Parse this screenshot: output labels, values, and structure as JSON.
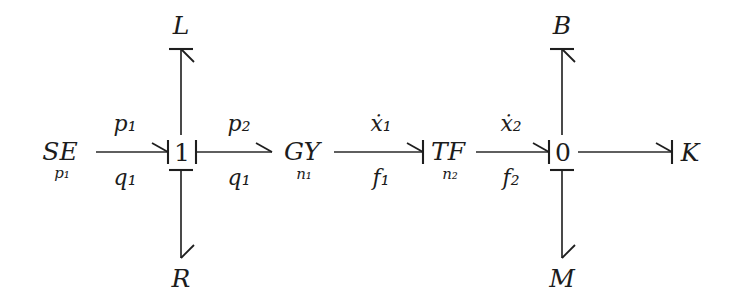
{
  "diagram": {
    "type": "bond-graph",
    "background_color": "#ffffff",
    "line_color": "#2a2a2a",
    "text_color": "#1c1c1c",
    "elements": [
      {
        "id": "SE",
        "label": "SE",
        "subscript": "p₁",
        "kind": "effort-source",
        "x": 60,
        "y": 152
      },
      {
        "id": "J1",
        "label": "1",
        "subscript": "",
        "kind": "one-junction",
        "x": 181,
        "y": 152
      },
      {
        "id": "GY",
        "label": "GY",
        "subscript": "n₁",
        "kind": "gyrator",
        "x": 300,
        "y": 152
      },
      {
        "id": "TF",
        "label": "TF",
        "subscript": "n₂",
        "kind": "transformer",
        "x": 441,
        "y": 152
      },
      {
        "id": "J0",
        "label": "0",
        "subscript": "",
        "kind": "zero-junction",
        "x": 562,
        "y": 152
      },
      {
        "id": "K",
        "label": "K",
        "subscript": "",
        "kind": "compliance",
        "x": 690,
        "y": 152
      },
      {
        "id": "L",
        "label": "L",
        "subscript": "",
        "kind": "inductance",
        "x": 181,
        "y": 25
      },
      {
        "id": "R",
        "label": "R",
        "subscript": "",
        "kind": "resistance",
        "x": 181,
        "y": 280
      },
      {
        "id": "B",
        "label": "B",
        "subscript": "",
        "kind": "damper",
        "x": 562,
        "y": 25
      },
      {
        "id": "M",
        "label": "M",
        "subscript": "",
        "kind": "mass",
        "x": 562,
        "y": 280
      }
    ],
    "bonds": [
      {
        "id": "bond-se-1",
        "from": "SE",
        "to": "J1",
        "effort": "p₁",
        "flow": "q₁",
        "orientation": "horizontal",
        "direction": "right",
        "causality_at": "head",
        "arrow_style": "half-arrow-lower"
      },
      {
        "id": "bond-1-gy",
        "from": "J1",
        "to": "GY",
        "effort": "p₂",
        "flow": "q₁",
        "orientation": "horizontal",
        "direction": "right",
        "causality_at": "tail",
        "arrow_style": "half-arrow-upper"
      },
      {
        "id": "bond-gy-tf",
        "from": "GY",
        "to": "TF",
        "effort": "ẋ₁",
        "flow": "f₁",
        "orientation": "horizontal",
        "direction": "right",
        "causality_at": "head",
        "arrow_style": "half-arrow-lower"
      },
      {
        "id": "bond-tf-0",
        "from": "TF",
        "to": "J0",
        "effort": "ẋ₂",
        "flow": "f₂",
        "orientation": "horizontal",
        "direction": "right",
        "causality_at": "head",
        "arrow_style": "half-arrow-lower"
      },
      {
        "id": "bond-0-k",
        "from": "J0",
        "to": "K",
        "effort": "",
        "flow": "",
        "orientation": "horizontal",
        "direction": "right",
        "causality_at": "head",
        "arrow_style": "half-arrow-lower"
      },
      {
        "id": "bond-1-l",
        "from": "J1",
        "to": "L",
        "effort": "",
        "flow": "",
        "orientation": "vertical",
        "direction": "up",
        "causality_at": "head",
        "arrow_style": "half-arrow-right"
      },
      {
        "id": "bond-1-r",
        "from": "J1",
        "to": "R",
        "effort": "",
        "flow": "",
        "orientation": "vertical",
        "direction": "down",
        "causality_at": "tail",
        "arrow_style": "half-arrow-right"
      },
      {
        "id": "bond-0-b",
        "from": "J0",
        "to": "B",
        "effort": "",
        "flow": "",
        "orientation": "vertical",
        "direction": "up",
        "causality_at": "head",
        "arrow_style": "half-arrow-right"
      },
      {
        "id": "bond-0-m",
        "from": "J0",
        "to": "M",
        "effort": "",
        "flow": "",
        "orientation": "vertical",
        "direction": "down",
        "causality_at": "tail",
        "arrow_style": "half-arrow-right"
      }
    ],
    "labels": {
      "se_main": "SE",
      "se_sub": "p₁",
      "j1": "1",
      "gy_main": "GY",
      "gy_sub": "n₁",
      "tf_main": "TF",
      "tf_sub": "n₂",
      "j0": "0",
      "k": "K",
      "l": "L",
      "r": "R",
      "b": "B",
      "m": "M",
      "bond1_effort": "p₁",
      "bond1_flow": "q₁",
      "bond2_effort": "p₂",
      "bond2_flow": "q₁",
      "bond3_effort": "ẋ₁",
      "bond3_flow": "f₁",
      "bond4_effort": "ẋ₂",
      "bond4_flow": "f₂"
    }
  }
}
